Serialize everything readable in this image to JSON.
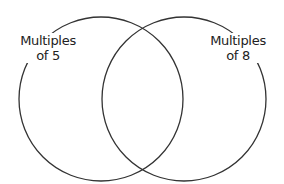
{
  "diagram": {
    "type": "venn",
    "stroke_color": "#333333",
    "background": "#ffffff",
    "sets": [
      {
        "id": "left",
        "label_line1": "Multiples",
        "label_line2": "of 5",
        "cx": 101,
        "cy": 99,
        "r": 83
      },
      {
        "id": "right",
        "label_line1": "Multiples",
        "label_line2": "of 8",
        "cx": 184,
        "cy": 99,
        "r": 83
      }
    ]
  }
}
